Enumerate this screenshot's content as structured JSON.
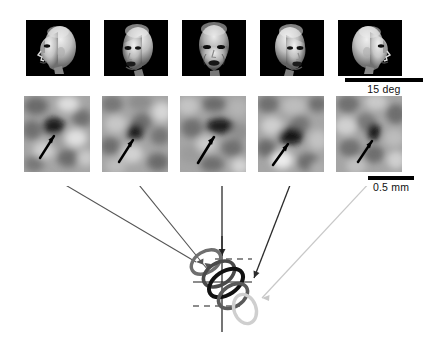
{
  "figure": {
    "background_color": "#ffffff"
  },
  "stimulus_row": {
    "name": "face-stimuli-row",
    "panel_background": "#000000",
    "items": [
      {
        "id": "stimulus-1",
        "label": "face profile left",
        "view": "left profile",
        "angle_deg": -90,
        "x": 26,
        "y": 20,
        "w": 64,
        "h": 56
      },
      {
        "id": "stimulus-2",
        "label": "face three-quarter left",
        "view": "three-quarter left",
        "angle_deg": -45,
        "x": 104,
        "y": 20,
        "w": 64,
        "h": 56
      },
      {
        "id": "stimulus-3",
        "label": "face frontal",
        "view": "frontal",
        "angle_deg": 0,
        "x": 182,
        "y": 20,
        "w": 64,
        "h": 56
      },
      {
        "id": "stimulus-4",
        "label": "face three-quarter right",
        "view": "three-quarter right",
        "angle_deg": 45,
        "x": 260,
        "y": 20,
        "w": 64,
        "h": 56
      },
      {
        "id": "stimulus-5",
        "label": "face profile right",
        "view": "right profile",
        "angle_deg": 90,
        "x": 338,
        "y": 20,
        "w": 64,
        "h": 56
      }
    ]
  },
  "map_row": {
    "name": "intrinsic-signal-map-row",
    "arrow_color": "#000000",
    "items": [
      {
        "id": "map-1",
        "label": "activity map left profile",
        "seed": 11,
        "blob_cx": 0.46,
        "blob_cy": 0.4,
        "blob_rx": 0.2,
        "blob_ry": 0.145,
        "blob_rot": -12,
        "arrow_from": [
          0.22,
          0.8
        ],
        "arrow_to": [
          0.42,
          0.5
        ],
        "x": 24,
        "y": 96,
        "w": 66,
        "h": 76
      },
      {
        "id": "map-2",
        "label": "activity map three-quarter left",
        "seed": 23,
        "blob_cx": 0.5,
        "blob_cy": 0.46,
        "blob_rx": 0.155,
        "blob_ry": 0.13,
        "blob_rot": -20,
        "arrow_from": [
          0.24,
          0.86
        ],
        "arrow_to": [
          0.44,
          0.56
        ],
        "x": 102,
        "y": 96,
        "w": 66,
        "h": 76
      },
      {
        "id": "map-3",
        "label": "activity map frontal",
        "seed": 37,
        "blob_cx": 0.58,
        "blob_cy": 0.4,
        "blob_rx": 0.22,
        "blob_ry": 0.115,
        "blob_rot": -18,
        "arrow_from": [
          0.27,
          0.87
        ],
        "arrow_to": [
          0.5,
          0.52
        ],
        "x": 180,
        "y": 96,
        "w": 66,
        "h": 76
      },
      {
        "id": "map-4",
        "label": "activity map three-quarter right",
        "seed": 53,
        "blob_cx": 0.5,
        "blob_cy": 0.52,
        "blob_rx": 0.21,
        "blob_ry": 0.135,
        "blob_rot": -16,
        "arrow_from": [
          0.22,
          0.9
        ],
        "arrow_to": [
          0.42,
          0.62
        ],
        "x": 258,
        "y": 96,
        "w": 66,
        "h": 76
      },
      {
        "id": "map-5",
        "label": "activity map right profile",
        "seed": 71,
        "blob_cx": 0.57,
        "blob_cy": 0.46,
        "blob_rx": 0.105,
        "blob_ry": 0.125,
        "blob_rot": -8,
        "arrow_from": [
          0.3,
          0.88
        ],
        "arrow_to": [
          0.5,
          0.58
        ],
        "x": 336,
        "y": 96,
        "w": 66,
        "h": 76
      }
    ]
  },
  "scale_bars": [
    {
      "id": "scalebar-visual-angle",
      "text": "15 deg",
      "x": 345,
      "y": 78,
      "w": 78
    },
    {
      "id": "scalebar-cortical-distance",
      "text": "0.5 mm",
      "x": 368,
      "y": 176,
      "w": 46
    }
  ],
  "schematic": {
    "name": "domain-overlap-schematic",
    "description": "Overlapping face-view domain outlines with crosshair reference axes",
    "axes": {
      "vertical_line": {
        "x": 222,
        "y1": 50,
        "y2": 146,
        "color": "#1a1a1a"
      },
      "horizontal_line": {
        "x1": 193,
        "x2": 252,
        "y": 96,
        "color": "#1a1a1a"
      },
      "dashed_lines": [
        {
          "x1": 215,
          "x2": 252,
          "y": 73,
          "color": "#1a1a1a"
        },
        {
          "x1": 193,
          "x2": 240,
          "y": 120,
          "color": "#1a1a1a"
        }
      ]
    },
    "domains": [
      {
        "id": "domain-1",
        "label": "domain left profile",
        "cx": 206,
        "cy": 76,
        "rx": 16,
        "ry": 10.5,
        "rot": -32,
        "color": "#6f6f6f",
        "stroke": 3.4
      },
      {
        "id": "domain-2",
        "label": "domain three-quarter left",
        "cx": 219,
        "cy": 88,
        "rx": 17,
        "ry": 11,
        "rot": -32,
        "color": "#4a4a4a",
        "stroke": 3.6
      },
      {
        "id": "domain-3",
        "label": "domain frontal",
        "cx": 226,
        "cy": 97,
        "rx": 19,
        "ry": 11.5,
        "rot": -34,
        "color": "#111111",
        "stroke": 4.0
      },
      {
        "id": "domain-4",
        "label": "domain three-quarter right",
        "cx": 233,
        "cy": 110,
        "rx": 16,
        "ry": 10.5,
        "rot": -34,
        "color": "#5a5a5a",
        "stroke": 3.6
      },
      {
        "id": "domain-5",
        "label": "domain right profile",
        "cx": 245,
        "cy": 123,
        "rx": 11,
        "ry": 15,
        "rot": -20,
        "color": "#cfcfcf",
        "stroke": 3.4
      }
    ],
    "leaders": [
      {
        "id": "leader-1",
        "from": [
          57,
          -6
        ],
        "to": [
          196,
          76
        ],
        "color": "#555555"
      },
      {
        "id": "leader-2",
        "from": [
          135,
          -6
        ],
        "to": [
          208,
          84
        ],
        "color": "#555555"
      },
      {
        "id": "leader-3",
        "from": [
          222,
          -6
        ],
        "to": [
          222,
          70
        ],
        "color": "#2b2b2b"
      },
      {
        "id": "leader-4",
        "from": [
          292,
          -6
        ],
        "to": [
          254,
          92
        ],
        "color": "#2b2b2b"
      },
      {
        "id": "leader-5",
        "from": [
          372,
          -6
        ],
        "to": [
          262,
          112
        ],
        "color": "#c8c8c8"
      }
    ]
  }
}
